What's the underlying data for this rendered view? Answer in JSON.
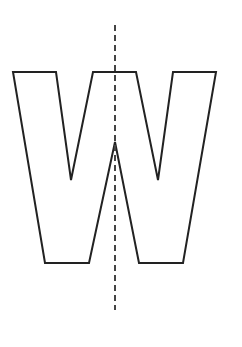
{
  "diagram": {
    "letter": "W",
    "stroke_color": "#222222",
    "axis_color": "#444444",
    "background": "#ffffff",
    "outline_points": "13,72 56,72 71,180 93,72 136,72 158,180 173,72 216,72 183,263 139,263 115,142 89,263 45,263",
    "symmetry_axis": {
      "x": 115,
      "y1": 25,
      "y2": 310,
      "style": "dashed"
    }
  }
}
